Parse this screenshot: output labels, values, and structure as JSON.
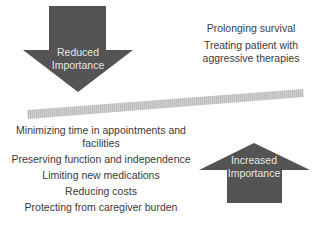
{
  "diagram": {
    "colors": {
      "arrow_fill": "#545454",
      "arrow_text": "#e6e6e6",
      "bar_fill": "#c8c8c8",
      "text": "#3a3a3a",
      "background": "#ffffff"
    },
    "down_arrow": {
      "line1": "Reduced",
      "line2": "Importance"
    },
    "up_arrow": {
      "line1": "Increased",
      "line2": "Importance"
    },
    "reduced_items": [
      "Prolonging survival",
      "Treating patient with aggressive therapies"
    ],
    "reduced_items_display": {
      "item0": "Prolonging survival",
      "item1_line1": "Treating patient with",
      "item1_line2": "aggressive therapies"
    },
    "increased_items": [
      "Minimizing time in appointments and facilities",
      "Preserving function and independence",
      "Limiting new medications",
      "Reducing costs",
      "Protecting from caregiver burden"
    ],
    "increased_items_display": {
      "item0_line1": "Minimizing time in appointments and",
      "item0_line2": "facilities",
      "item1": "Preserving function and independence",
      "item2": "Limiting new medications",
      "item3": "Reducing costs",
      "item4": "Protecting from caregiver burden"
    }
  }
}
